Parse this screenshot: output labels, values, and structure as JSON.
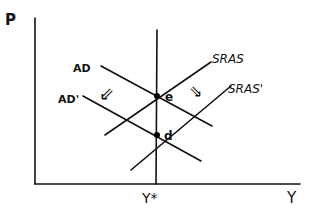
{
  "diagram": {
    "title": "",
    "axes": {
      "y_label": "P",
      "x_label": "Y",
      "x_marker_label": "Y*"
    },
    "curves": [
      {
        "id": "ad",
        "label": "AD",
        "type": "demand"
      },
      {
        "id": "ad_prime",
        "label": "AD'",
        "type": "demand"
      },
      {
        "id": "sras",
        "label": "SRAS",
        "type": "supply"
      },
      {
        "id": "sras_prime",
        "label": "SRAS'",
        "type": "supply"
      }
    ],
    "points": [
      {
        "id": "e",
        "label": "e"
      },
      {
        "id": "d",
        "label": "d"
      }
    ],
    "shift_arrows": [
      {
        "id": "ad-shift",
        "glyph": "⇙",
        "meaning": "AD shifts down/left"
      },
      {
        "id": "sras-shift",
        "glyph": "⇘",
        "meaning": "SRAS shifts down/right"
      }
    ],
    "colors": {
      "ink": "#111111",
      "background": "#ffffff"
    }
  }
}
